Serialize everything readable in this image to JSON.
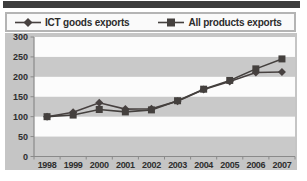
{
  "chart_data": {
    "type": "line",
    "categories": [
      "1998",
      "1999",
      "2000",
      "2001",
      "2002",
      "2003",
      "2004",
      "2005",
      "2006",
      "2007"
    ],
    "series": [
      {
        "name": "ICT goods exports",
        "marker": "diamond",
        "color": "#474140",
        "values": [
          100,
          111,
          135,
          119,
          120,
          139,
          168,
          188,
          211,
          212
        ]
      },
      {
        "name": "All products exports",
        "marker": "square",
        "color": "#44403e",
        "values": [
          100,
          104,
          118,
          112,
          117,
          140,
          169,
          191,
          220,
          245
        ]
      }
    ],
    "title": "",
    "xlabel": "",
    "ylabel": "",
    "ylim": [
      0,
      300
    ],
    "yticks": [
      0,
      50,
      100,
      150,
      200,
      250,
      300
    ],
    "grid": "alternating-horizontal-bands",
    "legend_position": "top"
  },
  "colors": {
    "top_bar": "#3d3d3d",
    "chart_background": "#c5c5c5",
    "band_gray": "#c9c9c9",
    "band_white": "#fcfcfc",
    "axis": "#8a8a8a",
    "tick_text": "#2e2e2e",
    "legend_border": "#b4b4b4",
    "legend_background": "#fafafa"
  }
}
